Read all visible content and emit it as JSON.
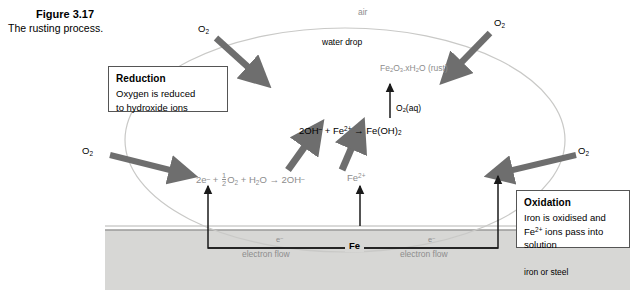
{
  "figure": {
    "number": "Figure 3.17",
    "caption": "The rusting process."
  },
  "callouts": {
    "reduction": {
      "title": "Reduction",
      "line1": "Oxygen is reduced",
      "line2": "to hydroxide ions"
    },
    "oxidation": {
      "title": "Oxidation",
      "line1": "Iron is oxidised and",
      "line2_pre": "Fe",
      "line2_sup": "2+",
      "line2_post": " ions pass into",
      "line3": "solution"
    }
  },
  "environment": {
    "air": "air",
    "water_drop": "water drop",
    "metal": "iron or steel"
  },
  "oxygen_labels": {
    "top_left": "O",
    "top_left_sub": "2",
    "top_right": "O",
    "top_right_sub": "2",
    "left": "O",
    "left_sub": "2",
    "right": "O",
    "right_sub": "2"
  },
  "species": {
    "rust": {
      "fe": "Fe",
      "fe_sub": "2",
      "o": "O",
      "o_sub": "3",
      "dot_x": ".xH",
      "h_sub": "2",
      "o2": "O",
      "name": " (rust)"
    },
    "oxygen_aq": {
      "symbol": "O",
      "sub": "2",
      "state": "(aq)"
    },
    "ferrous_ion": {
      "symbol": "Fe",
      "charge": "2+"
    },
    "iron_metal": "Fe"
  },
  "equations": {
    "cathode": {
      "electrons": "2e",
      "electrons_sup": "–",
      "plus1": " + ",
      "half_num": "1",
      "half_den": "2",
      "oxygen": "O",
      "oxygen_sub": "2",
      "plus2": " + H",
      "water_sub": "2",
      "water_o": "O",
      "arrow": "  →  ",
      "product": "2OH",
      "product_sup": "–"
    },
    "hydroxide": {
      "reactant1": "2OH",
      "reactant1_sup": "–",
      "plus": " + Fe",
      "reactant2_sup": "2+",
      "arrow": "  →  ",
      "product": "Fe(OH)",
      "product_sub": "2"
    }
  },
  "electron_flow": {
    "symbol": "e",
    "symbol_sup": "–",
    "label_left": "electron flow",
    "label_right": "electron flow"
  },
  "colors": {
    "background": "#ffffff",
    "metal_fill": "#d7d7d5",
    "metal_edge": "#9a9a98",
    "droplet_edge": "#c9c9c7",
    "thick_arrow": "#6e6e6e",
    "thin_arrow": "#1a1a1a",
    "grey_text": "#8d8d8d",
    "box_border": "#555555"
  }
}
